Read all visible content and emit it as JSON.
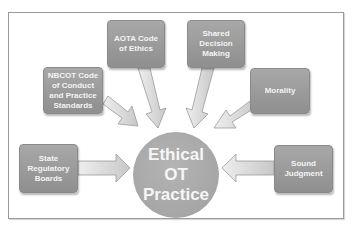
{
  "diagram": {
    "center": {
      "label": "Ethical\nOT\nPractice"
    },
    "nodes": [
      {
        "id": "aota",
        "label": "AOTA Code\nof Ethics"
      },
      {
        "id": "nbcot",
        "label": "NBCOT Code\nof  Conduct\nand Practice\nStandards"
      },
      {
        "id": "shared",
        "label": "Shared\nDecision\nMaking"
      },
      {
        "id": "morality",
        "label": "Morality"
      },
      {
        "id": "state",
        "label": "State\nRegulatory\nBoards"
      },
      {
        "id": "sound",
        "label": "Sound\nJudgment"
      }
    ],
    "edges": [
      {
        "from": "aota",
        "to": "center"
      },
      {
        "from": "nbcot",
        "to": "center"
      },
      {
        "from": "shared",
        "to": "center"
      },
      {
        "from": "morality",
        "to": "center"
      },
      {
        "from": "state",
        "to": "center"
      },
      {
        "from": "sound",
        "to": "center"
      }
    ],
    "colors": {
      "box_fill": "#9c9c9c",
      "circle_fill": "#aaaaaa",
      "arrow_fill": "#d6d6d6",
      "arrow_stroke": "#9a9a9a",
      "text": "#f4f4f4",
      "frame_border": "#9a9a9a"
    }
  }
}
